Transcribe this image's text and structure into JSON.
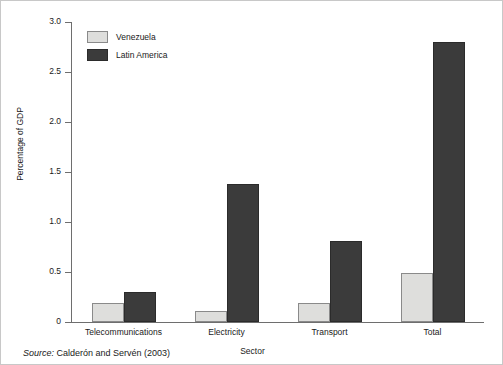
{
  "chart_data": {
    "type": "bar",
    "title": "",
    "xlabel": "Sector",
    "ylabel": "Percentage of GDP",
    "ylim": [
      0,
      3.0
    ],
    "yticks": [
      "0",
      "0.5",
      "1.0",
      "1.5",
      "2.0",
      "2.5",
      "3.0"
    ],
    "ytick_values": [
      0,
      0.5,
      1.0,
      1.5,
      2.0,
      2.5,
      3.0
    ],
    "grid": false,
    "legend_position": "upper-left-inside",
    "categories": [
      "Telecommunications",
      "Electricity",
      "Transport",
      "Total"
    ],
    "series": [
      {
        "name": "Venezuela",
        "color": "#dededc",
        "values": [
          0.19,
          0.11,
          0.19,
          0.49
        ]
      },
      {
        "name": "Latin America",
        "color": "#3b3b3b",
        "values": [
          0.3,
          1.38,
          0.81,
          2.8
        ]
      }
    ]
  },
  "legend": {
    "items": [
      {
        "label": "Venezuela"
      },
      {
        "label": "Latin America"
      }
    ]
  },
  "source": {
    "prefix": "Source:",
    "text": "Calderón and Servén (2003)"
  }
}
